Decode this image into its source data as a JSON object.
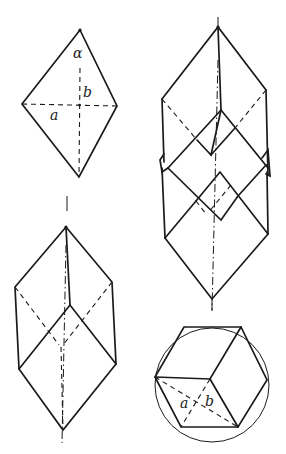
{
  "figure": {
    "panels": [
      {
        "id": "rhombus",
        "labels": {
          "angle": "α",
          "long_diag": "b",
          "short_diag": "a"
        }
      },
      {
        "id": "single-rhombohedron"
      },
      {
        "id": "stacked-rhombohedra"
      },
      {
        "id": "hexagonal-projection",
        "labels": {
          "short_diag": "a",
          "long_diag": "b"
        }
      }
    ],
    "colors": {
      "ink": "#1a1a1a",
      "paper": "#ffffff"
    }
  }
}
